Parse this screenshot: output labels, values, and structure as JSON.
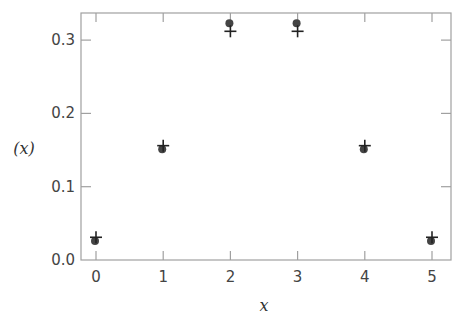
{
  "chart_data": {
    "type": "scatter",
    "title": "",
    "xlabel": "x",
    "ylabel": "(x)",
    "x": [
      0,
      1,
      2,
      3,
      4,
      5
    ],
    "series": [
      {
        "name": "dots",
        "marker": "circle",
        "color": "#444444",
        "values": [
          0.026,
          0.151,
          0.323,
          0.323,
          0.151,
          0.026
        ]
      },
      {
        "name": "crosses",
        "marker": "plus",
        "color": "#222222",
        "values": [
          0.031,
          0.156,
          0.312,
          0.312,
          0.156,
          0.031
        ]
      }
    ],
    "xlim": [
      -0.2,
      5.28
    ],
    "ylim": [
      0.0,
      0.337
    ],
    "xticks": [
      0,
      1,
      2,
      3,
      4,
      5
    ],
    "yticks": [
      0.0,
      0.1,
      0.2,
      0.3
    ],
    "ytick_labels": [
      "0.0",
      "0.1",
      "0.2",
      "0.3"
    ],
    "xtick_labels": [
      "0",
      "1",
      "2",
      "3",
      "4",
      "5"
    ],
    "grid": false,
    "legend": null
  },
  "colors": {
    "frame": "#a0a0a0",
    "text": "#444444"
  }
}
